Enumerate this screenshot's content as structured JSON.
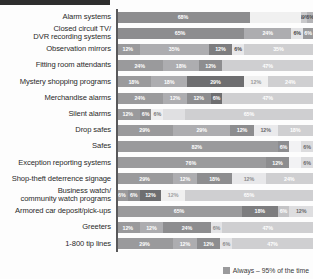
{
  "legend": {
    "series": [
      {
        "name": "Always – 95% of the time",
        "color": "#9a9a9c"
      }
    ],
    "position": "bottom-right"
  },
  "palette": {
    "s1": "#8d8d8f",
    "s2": "#adadb0",
    "s3": "#6e6e70",
    "s4": "#f0f0f0",
    "s5": "#cfcfd1",
    "axis": "#58585a",
    "label_text": "#2a2a2a",
    "value_text_on_dark": "#ffffff",
    "value_text_on_light": "#4a4a4a"
  },
  "chart_data": {
    "type": "bar",
    "title": "",
    "subtitle": "",
    "xlabel": "",
    "ylabel": "",
    "xlim": [
      0,
      100
    ],
    "grid": false,
    "orientation": "horizontal",
    "stacked": true,
    "normalized_percent": true,
    "legend_position": "bottom-right",
    "categories": [
      "Alarm systems",
      "Closed circuit TV/\nDVR recording systems",
      "Observation mirrors",
      "Fitting room attendants",
      "Mystery shopping programs",
      "Merchandise alarms",
      "Silent alarms",
      "Drop safes",
      "Safes",
      "Exception reporting systems",
      "Shop-theft deterrence signage",
      "Business watch/\ncommunity watch programs",
      "Armored car deposit/pick-ups",
      "Greeters",
      "1-800 tip lines"
    ],
    "series": [
      {
        "name": "Always – 95% of the time",
        "color": "#8d8d8f",
        "values": [
          68,
          65,
          12,
          24,
          18,
          24,
          12,
          29,
          82,
          76,
          29,
          6,
          65,
          12,
          29
        ]
      },
      {
        "name": "Segment 2",
        "color": "#adadb0",
        "values": [
          0,
          24,
          35,
          18,
          18,
          12,
          6,
          29,
          0,
          0,
          12,
          6,
          18,
          12,
          12
        ]
      },
      {
        "name": "Segment 3",
        "color": "#6e6e70",
        "values": [
          0,
          0,
          12,
          12,
          29,
          12,
          6,
          12,
          0,
          12,
          18,
          12,
          6,
          24,
          12
        ]
      },
      {
        "name": "Segment 4",
        "color": "#f0f0f0",
        "values": [
          26,
          5,
          6,
          0,
          12,
          6,
          6,
          12,
          6,
          6,
          12,
          12,
          0,
          6,
          6
        ]
      },
      {
        "name": "Segment 5",
        "color": "#cfcfd1",
        "values": [
          6,
          6,
          35,
          47,
          24,
          47,
          65,
          18,
          6,
          6,
          24,
          65,
          12,
          47,
          47
        ]
      }
    ],
    "rows": [
      {
        "label": "Alarm systems",
        "segments": [
          {
            "value": 68,
            "label": "68%",
            "color": "#8d8d8f",
            "text": "#ffffff",
            "show": true
          },
          {
            "value": 26,
            "label": "",
            "color": "#f0f0f0",
            "text": "#4a4a4a",
            "show": false
          },
          {
            "value": 3,
            "label": "69%",
            "color": "#c9c9cb",
            "text": "#4a4a4a",
            "show": true
          },
          {
            "value": 3,
            "label": "6%",
            "color": "#b3b3b6",
            "text": "#4a4a4a",
            "show": true
          }
        ]
      },
      {
        "label": "Closed circuit TV/\nDVR recording systems",
        "segments": [
          {
            "value": 65,
            "label": "65%",
            "color": "#8d8d8f",
            "text": "#ffffff",
            "show": true
          },
          {
            "value": 24,
            "label": "24%",
            "color": "#adadb0",
            "text": "#ffffff",
            "show": true
          },
          {
            "value": 6,
            "label": "6%",
            "color": "#e4e4e6",
            "text": "#4a4a4a",
            "show": true
          },
          {
            "value": 5,
            "label": "6%",
            "color": "#9a9a9c",
            "text": "#ffffff",
            "show": true
          }
        ]
      },
      {
        "label": "Observation mirrors",
        "segments": [
          {
            "value": 12,
            "label": "12%",
            "color": "#9a9a9c",
            "text": "#ffffff",
            "show": true
          },
          {
            "value": 35,
            "label": "35%",
            "color": "#adadb0",
            "text": "#ffffff",
            "show": true
          },
          {
            "value": 12,
            "label": "12%",
            "color": "#7d7d7f",
            "text": "#ffffff",
            "show": true
          },
          {
            "value": 6,
            "label": "6%",
            "color": "#e8e8ea",
            "text": "#4a4a4a",
            "show": true
          },
          {
            "value": 35,
            "label": "35%",
            "color": "#cfcfd1",
            "text": "#ffffff",
            "show": true
          }
        ]
      },
      {
        "label": "Fitting room attendants",
        "segments": [
          {
            "value": 24,
            "label": "24%",
            "color": "#9a9a9c",
            "text": "#ffffff",
            "show": true
          },
          {
            "value": 18,
            "label": "18%",
            "color": "#adadb0",
            "text": "#ffffff",
            "show": true
          },
          {
            "value": 12,
            "label": "12%",
            "color": "#8d8d8f",
            "text": "#ffffff",
            "show": true
          },
          {
            "value": 46,
            "label": "47%",
            "color": "#cfcfd1",
            "text": "#ffffff",
            "show": true
          }
        ]
      },
      {
        "label": "Mystery shopping programs",
        "segments": [
          {
            "value": 18,
            "label": "18%",
            "color": "#9a9a9c",
            "text": "#ffffff",
            "show": true
          },
          {
            "value": 18,
            "label": "18%",
            "color": "#adadb0",
            "text": "#ffffff",
            "show": true
          },
          {
            "value": 29,
            "label": "29%",
            "color": "#6e6e70",
            "text": "#ffffff",
            "show": true
          },
          {
            "value": 12,
            "label": "12%",
            "color": "#f0f0f0",
            "text": "#9a9a9c",
            "show": true
          },
          {
            "value": 23,
            "label": "24%",
            "color": "#cfcfd1",
            "text": "#ffffff",
            "show": true
          }
        ]
      },
      {
        "label": "Merchandise alarms",
        "segments": [
          {
            "value": 24,
            "label": "24%",
            "color": "#9a9a9c",
            "text": "#ffffff",
            "show": true
          },
          {
            "value": 12,
            "label": "12%",
            "color": "#adadb0",
            "text": "#ffffff",
            "show": true
          },
          {
            "value": 12,
            "label": "12%",
            "color": "#8d8d8f",
            "text": "#ffffff",
            "show": true
          },
          {
            "value": 6,
            "label": "6%",
            "color": "#6e6e70",
            "text": "#ffffff",
            "show": true
          },
          {
            "value": 46,
            "label": "47%",
            "color": "#cfcfd1",
            "text": "#ffffff",
            "show": true
          }
        ]
      },
      {
        "label": "Silent alarms",
        "segments": [
          {
            "value": 12,
            "label": "12%",
            "color": "#9a9a9c",
            "text": "#ffffff",
            "show": true
          },
          {
            "value": 6,
            "label": "6%",
            "color": "#8d8d8f",
            "text": "#ffffff",
            "show": true
          },
          {
            "value": 6,
            "label": "6%",
            "color": "#eeeef0",
            "text": "#7a7a7c",
            "show": true
          },
          {
            "value": 11,
            "label": "",
            "color": "#e0e0e2",
            "text": "#4a4a4a",
            "show": false
          },
          {
            "value": 65,
            "label": "65%",
            "color": "#cfcfd1",
            "text": "#ffffff",
            "show": true
          }
        ]
      },
      {
        "label": "Drop safes",
        "segments": [
          {
            "value": 29,
            "label": "29%",
            "color": "#9a9a9c",
            "text": "#ffffff",
            "show": true
          },
          {
            "value": 29,
            "label": "29%",
            "color": "#adadb0",
            "text": "#ffffff",
            "show": true
          },
          {
            "value": 12,
            "label": "12%",
            "color": "#8d8d8f",
            "text": "#ffffff",
            "show": true
          },
          {
            "value": 12,
            "label": "12%",
            "color": "#eaeaec",
            "text": "#6a6a6c",
            "show": true
          },
          {
            "value": 18,
            "label": "18%",
            "color": "#cfcfd1",
            "text": "#ffffff",
            "show": true
          }
        ]
      },
      {
        "label": "Safes",
        "segments": [
          {
            "value": 82,
            "label": "82%",
            "color": "#9a9a9c",
            "text": "#ffffff",
            "show": true
          },
          {
            "value": 6,
            "label": "6%",
            "color": "#8d8d8f",
            "text": "#ffffff",
            "show": true
          },
          {
            "value": 6,
            "label": "",
            "color": "#f2f2f4",
            "text": "#4a4a4a",
            "show": false
          },
          {
            "value": 6,
            "label": "6%",
            "color": "#dcdcde",
            "text": "#6a6a6c",
            "show": true
          }
        ]
      },
      {
        "label": "Exception reporting systems",
        "segments": [
          {
            "value": 76,
            "label": "76%",
            "color": "#9a9a9c",
            "text": "#ffffff",
            "show": true
          },
          {
            "value": 12,
            "label": "12%",
            "color": "#8d8d8f",
            "text": "#ffffff",
            "show": true
          },
          {
            "value": 6,
            "label": "",
            "color": "#f2f2f4",
            "text": "#4a4a4a",
            "show": false
          },
          {
            "value": 6,
            "label": "6%",
            "color": "#dcdcde",
            "text": "#6a6a6c",
            "show": true
          }
        ]
      },
      {
        "label": "Shop-theft deterrence signage",
        "segments": [
          {
            "value": 29,
            "label": "29%",
            "color": "#9a9a9c",
            "text": "#ffffff",
            "show": true
          },
          {
            "value": 12,
            "label": "12%",
            "color": "#adadb0",
            "text": "#ffffff",
            "show": true
          },
          {
            "value": 18,
            "label": "18%",
            "color": "#8d8d8f",
            "text": "#ffffff",
            "show": true
          },
          {
            "value": 17,
            "label": "12%",
            "color": "#e8e8ea",
            "text": "#8a8a8c",
            "show": true
          },
          {
            "value": 24,
            "label": "24%",
            "color": "#cfcfd1",
            "text": "#ffffff",
            "show": true
          }
        ]
      },
      {
        "label": "Business watch/\ncommunity watch programs",
        "segments": [
          {
            "value": 6,
            "label": "6%",
            "color": "#9a9a9c",
            "text": "#ffffff",
            "show": true
          },
          {
            "value": 6,
            "label": "6%",
            "color": "#8d8d8f",
            "text": "#ffffff",
            "show": true
          },
          {
            "value": 11,
            "label": "12%",
            "color": "#6e6e70",
            "text": "#ffffff",
            "show": true
          },
          {
            "value": 12,
            "label": "12%",
            "color": "#f0f0f0",
            "text": "#a0a0a2",
            "show": true
          },
          {
            "value": 65,
            "label": "65%",
            "color": "#cfcfd1",
            "text": "#ffffff",
            "show": true
          }
        ]
      },
      {
        "label": "Armored car deposit/pick-ups",
        "segments": [
          {
            "value": 64,
            "label": "65%",
            "color": "#9a9a9c",
            "text": "#ffffff",
            "show": true
          },
          {
            "value": 18,
            "label": "18%",
            "color": "#7d7d7f",
            "text": "#ffffff",
            "show": true
          },
          {
            "value": 6,
            "label": "6%",
            "color": "#c4c4c6",
            "text": "#ffffff",
            "show": true
          },
          {
            "value": 12,
            "label": "12%",
            "color": "#dedee0",
            "text": "#6a6a6c",
            "show": true
          }
        ]
      },
      {
        "label": "Greeters",
        "segments": [
          {
            "value": 12,
            "label": "12%",
            "color": "#9a9a9c",
            "text": "#ffffff",
            "show": true
          },
          {
            "value": 12,
            "label": "12%",
            "color": "#adadb0",
            "text": "#ffffff",
            "show": true
          },
          {
            "value": 24,
            "label": "24%",
            "color": "#8d8d8f",
            "text": "#ffffff",
            "show": true
          },
          {
            "value": 6,
            "label": "6%",
            "color": "#e4e4e6",
            "text": "#8a8a8c",
            "show": true
          },
          {
            "value": 46,
            "label": "47%",
            "color": "#cfcfd1",
            "text": "#ffffff",
            "show": true
          }
        ]
      },
      {
        "label": "1-800 tip lines",
        "segments": [
          {
            "value": 29,
            "label": "29%",
            "color": "#9a9a9c",
            "text": "#ffffff",
            "show": true
          },
          {
            "value": 12,
            "label": "12%",
            "color": "#adadb0",
            "text": "#ffffff",
            "show": true
          },
          {
            "value": 12,
            "label": "12%",
            "color": "#8d8d8f",
            "text": "#ffffff",
            "show": true
          },
          {
            "value": 6,
            "label": "6%",
            "color": "#e4e4e6",
            "text": "#8a8a8c",
            "show": true
          },
          {
            "value": 41,
            "label": "47%",
            "color": "#cfcfd1",
            "text": "#ffffff",
            "show": true
          }
        ]
      }
    ]
  }
}
